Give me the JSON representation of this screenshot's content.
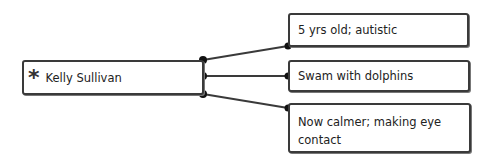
{
  "diagram": {
    "root": {
      "icon": "asterisk-icon",
      "icon_glyph": "*",
      "label": "Kelly Sullivan"
    },
    "children": [
      {
        "label": "5 yrs old; autistic"
      },
      {
        "label": "Swam with dolphins"
      },
      {
        "label": "Now calmer; making eye contact"
      }
    ],
    "colors": {
      "stroke": "#3a3a3a",
      "background": "#ffffff"
    }
  }
}
